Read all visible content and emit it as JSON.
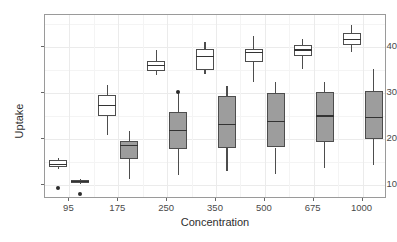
{
  "chart_data": {
    "type": "boxplot",
    "title": "",
    "subtitle": "",
    "xlabel": "Concentration",
    "ylabel": "Uptake",
    "categories": [
      "95",
      "175",
      "250",
      "350",
      "500",
      "675",
      "1000"
    ],
    "xtick_labels": [
      "95",
      "175",
      "250",
      "350",
      "500",
      "675",
      "1000"
    ],
    "ytick_labels": [
      "10",
      "20",
      "30",
      "40"
    ],
    "ytick_values": [
      10,
      20,
      30,
      40
    ],
    "ylim": [
      7.0,
      47.0
    ],
    "grid": true,
    "legend": "none",
    "legend_position": "none",
    "series": [
      {
        "name": "white",
        "fill_color": "#ffffff",
        "boxes": [
          {
            "category": "95",
            "whisker_low": 13.6,
            "q1": 14.0,
            "median": 14.5,
            "q3": 15.4,
            "whisker_high": 16.0,
            "outliers": [
              9.3
            ]
          },
          {
            "category": "175",
            "whisker_low": 21.0,
            "q1": 25.0,
            "median": 27.3,
            "q3": 29.6,
            "whisker_high": 31.8,
            "outliers": []
          },
          {
            "category": "250",
            "whisker_low": 34.0,
            "q1": 34.8,
            "median": 36.0,
            "q3": 37.0,
            "whisker_high": 39.5,
            "outliers": []
          },
          {
            "category": "350",
            "whisker_low": 34.2,
            "q1": 35.0,
            "median": 38.0,
            "q3": 39.7,
            "whisker_high": 41.2,
            "outliers": []
          },
          {
            "category": "500",
            "whisker_low": 32.4,
            "q1": 36.7,
            "median": 38.8,
            "q3": 39.6,
            "whisker_high": 42.5,
            "outliers": []
          },
          {
            "category": "675",
            "whisker_low": 35.3,
            "q1": 38.0,
            "median": 39.4,
            "q3": 40.5,
            "whisker_high": 41.8,
            "outliers": []
          },
          {
            "category": "1000",
            "whisker_low": 38.9,
            "q1": 40.4,
            "median": 41.7,
            "q3": 43.0,
            "whisker_high": 44.8,
            "outliers": []
          }
        ]
      },
      {
        "name": "gray",
        "fill_color": "#9d9d9d",
        "boxes": [
          {
            "category": "95",
            "whisker_low": 10.2,
            "q1": 10.5,
            "median": 10.8,
            "q3": 11.1,
            "whisker_high": 11.3,
            "outliers": [
              8.2
            ]
          },
          {
            "category": "175",
            "whisker_low": 11.4,
            "q1": 15.8,
            "median": 18.6,
            "q3": 19.6,
            "whisker_high": 21.8,
            "outliers": []
          },
          {
            "category": "250",
            "whisker_low": 12.3,
            "q1": 17.9,
            "median": 21.9,
            "q3": 26.0,
            "whisker_high": 30.0,
            "outliers": [
              30.3
            ]
          },
          {
            "category": "350",
            "whisker_low": 13.0,
            "q1": 18.1,
            "median": 23.2,
            "q3": 29.4,
            "whisker_high": 31.5,
            "outliers": []
          },
          {
            "category": "500",
            "whisker_low": 12.5,
            "q1": 18.2,
            "median": 23.8,
            "q3": 30.0,
            "whisker_high": 32.4,
            "outliers": []
          },
          {
            "category": "675",
            "whisker_low": 13.7,
            "q1": 19.4,
            "median": 25.0,
            "q3": 30.2,
            "whisker_high": 32.4,
            "outliers": []
          },
          {
            "category": "1000",
            "whisker_low": 14.4,
            "q1": 20.1,
            "median": 24.7,
            "q3": 30.4,
            "whisker_high": 35.2,
            "outliers": []
          }
        ]
      }
    ]
  },
  "colors": {
    "panel_border": "#9a9a9a",
    "grid_major": "#ebebeb",
    "grid_minor": "#f4f4f4",
    "box_outline": "#4d4d4d",
    "median": "#333333",
    "outlier": "#2b2b2b",
    "axis_text": "#4a4a4a",
    "axis_title": "#2e2e2e"
  }
}
